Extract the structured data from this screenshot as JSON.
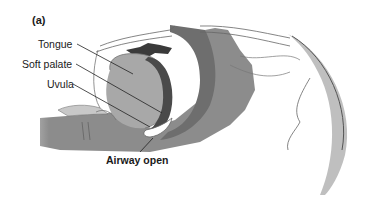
{
  "figure": {
    "panel_label": "(a)",
    "labels": {
      "tongue": "Tongue",
      "soft_palate": "Soft palate",
      "uvula": "Uvula",
      "airway": "Airway open"
    },
    "colors": {
      "tissue_dark": "#6e6e6e",
      "tissue_mid": "#9a9a9a",
      "tissue_light": "#bdbdbd",
      "airway": "#8c8c8c",
      "outline": "#555555",
      "text": "#1a1a1a"
    }
  }
}
